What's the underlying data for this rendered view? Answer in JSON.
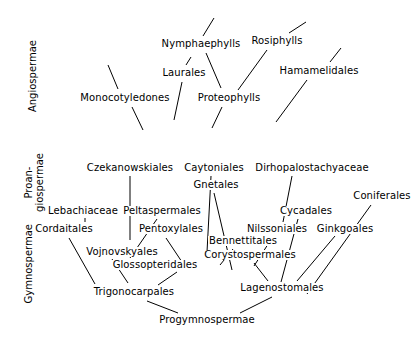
{
  "diagram": {
    "background_color": "#ffffff",
    "line_color": "#000000",
    "text_color": "#000000",
    "group_labels": [
      {
        "name": "angiospermae",
        "text": "Angiospermae",
        "x": 34,
        "y": 78
      },
      {
        "name": "proangiospermae",
        "line1": "Proan-",
        "line2": "giospermae",
        "x": 34,
        "y": 182
      },
      {
        "name": "gymnospermae",
        "text": "Gymnospermae",
        "x": 30,
        "y": 262
      }
    ],
    "taxa": [
      {
        "name": "nymphaephylls",
        "label": "Nymphaephylls",
        "x": 201,
        "y": 44
      },
      {
        "name": "rosiphylls",
        "label": "Rosiphylls",
        "x": 277,
        "y": 41
      },
      {
        "name": "laurales",
        "label": "Laurales",
        "x": 184,
        "y": 73
      },
      {
        "name": "hamamelidales",
        "label": "Hamamelidales",
        "x": 319,
        "y": 71
      },
      {
        "name": "monocotyledones",
        "label": "Monocotyledones",
        "x": 125,
        "y": 98
      },
      {
        "name": "proteophylls",
        "label": "Proteophylls",
        "x": 229,
        "y": 98
      },
      {
        "name": "czekanowskiales",
        "label": "Czekanowskiales",
        "x": 130,
        "y": 168
      },
      {
        "name": "caytoniales",
        "label": "Caytoniales",
        "x": 214,
        "y": 168
      },
      {
        "name": "dirhopalostachyaceae",
        "label": "Dirhopalostachyaceae",
        "x": 312,
        "y": 168
      },
      {
        "name": "gnetales",
        "label": "Gnetales",
        "x": 216,
        "y": 185
      },
      {
        "name": "coniferales",
        "label": "Coniferales",
        "x": 382,
        "y": 196
      },
      {
        "name": "lebachiaceae",
        "label": "Lebachiaceae",
        "x": 83,
        "y": 211
      },
      {
        "name": "peltaspermales",
        "label": "Peltaspermales",
        "x": 162,
        "y": 211
      },
      {
        "name": "cycadales",
        "label": "Cycadales",
        "x": 306,
        "y": 211
      },
      {
        "name": "cordaitales",
        "label": "Cordaitales",
        "x": 64,
        "y": 229
      },
      {
        "name": "pentoxylales",
        "label": "Pentoxylales",
        "x": 171,
        "y": 229
      },
      {
        "name": "nilssoniales",
        "label": "Nilssoniales",
        "x": 277,
        "y": 229
      },
      {
        "name": "ginkgoales",
        "label": "Ginkgoales",
        "x": 345,
        "y": 229
      },
      {
        "name": "bennettitales",
        "label": "Bennettitales",
        "x": 243,
        "y": 241
      },
      {
        "name": "vojnovskyales",
        "label": "Vojnovskyales",
        "x": 122,
        "y": 252
      },
      {
        "name": "corystospermales",
        "label": "Corystospermales",
        "x": 250,
        "y": 255
      },
      {
        "name": "glossopteridales",
        "label": "Glossopteridales",
        "x": 155,
        "y": 265
      },
      {
        "name": "trigonocarpales",
        "label": "Trigonocarpales",
        "x": 134,
        "y": 292
      },
      {
        "name": "lagenostomales",
        "label": "Lagenostomales",
        "x": 282,
        "y": 288
      },
      {
        "name": "progymnospermae",
        "label": "Progymnospermae",
        "x": 207,
        "y": 320
      }
    ],
    "branches": [
      {
        "name": "branch-nymphaephylls-up",
        "x1": 214,
        "y1": 18,
        "x2": 203,
        "y2": 36
      },
      {
        "name": "branch-nymphaephylls-down",
        "x1": 206,
        "y1": 53,
        "x2": 221,
        "y2": 88
      },
      {
        "name": "branch-rosiphylls-up",
        "x1": 306,
        "y1": 22,
        "x2": 289,
        "y2": 33
      },
      {
        "name": "branch-rosiphylls-down",
        "x1": 267,
        "y1": 50,
        "x2": 238,
        "y2": 90
      },
      {
        "name": "branch-laurales-up",
        "x1": 191,
        "y1": 57,
        "x2": 186,
        "y2": 65
      },
      {
        "name": "branch-laurales-down",
        "x1": 182,
        "y1": 82,
        "x2": 174,
        "y2": 120
      },
      {
        "name": "branch-hamamelidales-up",
        "x1": 341,
        "y1": 48,
        "x2": 330,
        "y2": 62
      },
      {
        "name": "branch-hamamelidales-down",
        "x1": 307,
        "y1": 80,
        "x2": 276,
        "y2": 122
      },
      {
        "name": "branch-monocotyledones-up",
        "x1": 108,
        "y1": 65,
        "x2": 118,
        "y2": 89
      },
      {
        "name": "branch-monocotyledones-down",
        "x1": 132,
        "y1": 107,
        "x2": 143,
        "y2": 130
      },
      {
        "name": "branch-proteophylls-down",
        "x1": 222,
        "y1": 107,
        "x2": 212,
        "y2": 128
      },
      {
        "name": "branch-czekanowskiales-down",
        "x1": 130,
        "y1": 176,
        "x2": 130,
        "y2": 240
      },
      {
        "name": "branch-caytoniales-down",
        "x1": 211,
        "y1": 176,
        "x2": 207,
        "y2": 252
      },
      {
        "name": "branch-gnetales-down",
        "x1": 214,
        "y1": 193,
        "x2": 232,
        "y2": 270
      },
      {
        "name": "branch-dirhopalostachyaceae-down",
        "x1": 292,
        "y1": 176,
        "x2": 283,
        "y2": 222
      },
      {
        "name": "branch-lebachiaceae-down",
        "x1": 85,
        "y1": 218,
        "x2": 85,
        "y2": 222
      },
      {
        "name": "branch-cordaitales-down",
        "x1": 69,
        "y1": 238,
        "x2": 95,
        "y2": 284
      },
      {
        "name": "branch-peltaspermales-down",
        "x1": 157,
        "y1": 219,
        "x2": 130,
        "y2": 258
      },
      {
        "name": "branch-pentoxylales-down",
        "x1": 166,
        "y1": 238,
        "x2": 182,
        "y2": 262
      },
      {
        "name": "branch-vojnovskyales-down",
        "x1": 112,
        "y1": 259,
        "x2": 128,
        "y2": 283
      },
      {
        "name": "branch-glossopteridales-down",
        "x1": 177,
        "y1": 272,
        "x2": 158,
        "y2": 285
      },
      {
        "name": "branch-cycadales-down",
        "x1": 298,
        "y1": 219,
        "x2": 281,
        "y2": 282
      },
      {
        "name": "branch-nilssoniales-down",
        "x1": 272,
        "y1": 238,
        "x2": 254,
        "y2": 266
      },
      {
        "name": "branch-ginkgoales-down",
        "x1": 335,
        "y1": 236,
        "x2": 297,
        "y2": 281
      },
      {
        "name": "branch-bennettitales-down",
        "x1": 233,
        "y1": 249,
        "x2": 220,
        "y2": 265
      },
      {
        "name": "branch-corystospermales-down",
        "x1": 254,
        "y1": 263,
        "x2": 268,
        "y2": 281
      },
      {
        "name": "branch-coniferales-down",
        "x1": 371,
        "y1": 205,
        "x2": 307,
        "y2": 294
      },
      {
        "name": "branch-trigonocarpales-down",
        "x1": 147,
        "y1": 301,
        "x2": 178,
        "y2": 313
      },
      {
        "name": "branch-lagenostomales-down",
        "x1": 272,
        "y1": 297,
        "x2": 240,
        "y2": 313
      }
    ]
  }
}
